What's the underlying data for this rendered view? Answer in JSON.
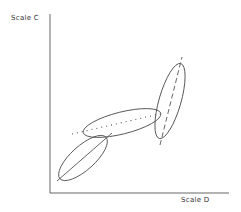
{
  "diagram": {
    "y_axis_label": "Scale C",
    "x_axis_label": "Scale D",
    "stroke_color": "#555555",
    "groups": [
      {
        "name": "lower-left",
        "axis_line_style": "solid"
      },
      {
        "name": "middle",
        "axis_line_style": "dotted"
      },
      {
        "name": "upper-right",
        "axis_line_style": "dashed"
      }
    ]
  }
}
